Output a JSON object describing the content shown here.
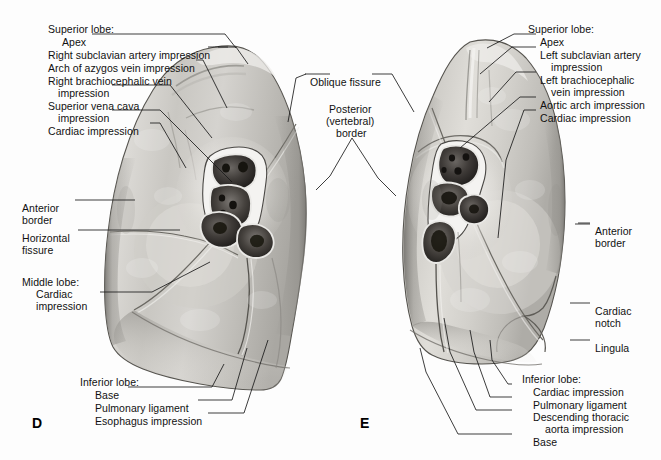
{
  "figure": {
    "background_color": "#fdfdfd",
    "line_color": "#1a1a1a"
  },
  "panels": [
    {
      "id": "D",
      "letter": "D",
      "name": "right-lung-medial-surface",
      "x": 32,
      "y": 415
    },
    {
      "id": "E",
      "letter": "E",
      "name": "left-lung-medial-surface",
      "x": 360,
      "y": 415
    }
  ],
  "labels": {
    "left_block": [
      {
        "name": "superior-lobe-heading-d",
        "text": "Superior lobe:",
        "x": 48,
        "y": 24
      },
      {
        "name": "apex-d",
        "text": "Apex",
        "x": 62,
        "y": 37
      },
      {
        "name": "right-subclavian-artery-impression",
        "text": "Right subclavian artery impression",
        "x": 48,
        "y": 50
      },
      {
        "name": "arch-of-azygos-vein-impression",
        "text": "Arch of azygos vein impression",
        "x": 48,
        "y": 63
      },
      {
        "name": "right-brachiocephalic-vein-impression-l1",
        "text": "Right brachiocephalic vein",
        "x": 48,
        "y": 76
      },
      {
        "name": "right-brachiocephalic-vein-impression-l2",
        "text": "impression",
        "x": 58,
        "y": 88
      },
      {
        "name": "superior-vena-cava-impression-l1",
        "text": "Superior vena cava",
        "x": 48,
        "y": 101
      },
      {
        "name": "superior-vena-cava-impression-l2",
        "text": "impression",
        "x": 58,
        "y": 113
      },
      {
        "name": "cardiac-impression-d",
        "text": "Cardiac impression",
        "x": 48,
        "y": 126
      },
      {
        "name": "anterior-border-d-l1",
        "text": "Anterior",
        "x": 22,
        "y": 203
      },
      {
        "name": "anterior-border-d-l2",
        "text": "border",
        "x": 22,
        "y": 215
      },
      {
        "name": "horizontal-fissure-l1",
        "text": "Horizontal",
        "x": 22,
        "y": 233
      },
      {
        "name": "horizontal-fissure-l2",
        "text": "fissure",
        "x": 22,
        "y": 245
      },
      {
        "name": "middle-lobe-heading",
        "text": "Middle lobe:",
        "x": 22,
        "y": 277
      },
      {
        "name": "middle-lobe-cardiac-l1",
        "text": "Cardiac",
        "x": 36,
        "y": 289
      },
      {
        "name": "middle-lobe-cardiac-l2",
        "text": "impression",
        "x": 36,
        "y": 301
      }
    ],
    "bottom_left_block": [
      {
        "name": "inferior-lobe-heading-d",
        "text": "Inferior lobe:",
        "x": 80,
        "y": 377
      },
      {
        "name": "base-d",
        "text": "Base",
        "x": 95,
        "y": 390
      },
      {
        "name": "pulmonary-ligament-d",
        "text": "Pulmonary ligament",
        "x": 95,
        "y": 403
      },
      {
        "name": "esophagus-impression",
        "text": "Esophagus impression",
        "x": 95,
        "y": 416
      }
    ],
    "center_block": [
      {
        "name": "oblique-fissure",
        "text": "Oblique fissure",
        "x": 310,
        "y": 77
      },
      {
        "name": "posterior-vertebral-border-l1",
        "text": "Posterior",
        "x": 329,
        "y": 104
      },
      {
        "name": "posterior-vertebral-border-l2",
        "text": "(vertebral)",
        "x": 326,
        "y": 116
      },
      {
        "name": "posterior-vertebral-border-l3",
        "text": "border",
        "x": 336,
        "y": 128
      }
    ],
    "right_block": [
      {
        "name": "superior-lobe-heading-e",
        "text": "Superior lobe:",
        "x": 528,
        "y": 24
      },
      {
        "name": "apex-e",
        "text": "Apex",
        "x": 540,
        "y": 37
      },
      {
        "name": "left-subclavian-artery-impression-l1",
        "text": "Left subclavian artery",
        "x": 540,
        "y": 50
      },
      {
        "name": "left-subclavian-artery-impression-l2",
        "text": "impression",
        "x": 551,
        "y": 62
      },
      {
        "name": "left-brachiocephalic-vein-impression-l1",
        "text": "Left brachiocephalic",
        "x": 540,
        "y": 75
      },
      {
        "name": "left-brachiocephalic-vein-impression-l2",
        "text": "vein impression",
        "x": 551,
        "y": 87
      },
      {
        "name": "aortic-arch-impression",
        "text": "Aortic arch impression",
        "x": 540,
        "y": 100
      },
      {
        "name": "cardiac-impression-e",
        "text": "Cardiac impression",
        "x": 540,
        "y": 113
      },
      {
        "name": "anterior-border-e-l1",
        "text": "Anterior",
        "x": 595,
        "y": 226
      },
      {
        "name": "anterior-border-e-l2",
        "text": "border",
        "x": 595,
        "y": 238
      },
      {
        "name": "cardiac-notch-l1",
        "text": "Cardiac",
        "x": 595,
        "y": 306
      },
      {
        "name": "cardiac-notch-l2",
        "text": "notch",
        "x": 595,
        "y": 318
      },
      {
        "name": "lingula",
        "text": "Lingula",
        "x": 595,
        "y": 343
      }
    ],
    "bottom_right_block": [
      {
        "name": "inferior-lobe-heading-e",
        "text": "Inferior lobe:",
        "x": 522,
        "y": 374
      },
      {
        "name": "cardiac-impression-inferior-e",
        "text": "Cardiac impression",
        "x": 533,
        "y": 387
      },
      {
        "name": "pulmonary-ligament-e",
        "text": "Pulmonary ligament",
        "x": 533,
        "y": 400
      },
      {
        "name": "descending-thoracic-aorta-impression-l1",
        "text": "Descending thoracic",
        "x": 533,
        "y": 412
      },
      {
        "name": "descending-thoracic-aorta-impression-l2",
        "text": "aorta impression",
        "x": 545,
        "y": 424
      },
      {
        "name": "base-e",
        "text": "Base",
        "x": 533,
        "y": 437
      }
    ]
  }
}
